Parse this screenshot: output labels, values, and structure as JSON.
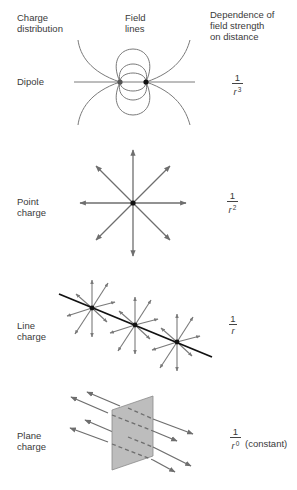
{
  "headers": {
    "charge_distribution": [
      "Charge",
      "distribution"
    ],
    "field_lines": [
      "Field",
      "lines"
    ],
    "dependence": [
      "Dependence of",
      "field strength",
      "on distance"
    ]
  },
  "rows": [
    {
      "label": [
        "Dipole"
      ],
      "diagram": "dipole-field-lines",
      "fraction": {
        "numerator": "1",
        "denominator": "r",
        "exponent": "3",
        "note": ""
      }
    },
    {
      "label": [
        "Point",
        "charge"
      ],
      "diagram": "point-charge-radial-arrows",
      "fraction": {
        "numerator": "1",
        "denominator": "r",
        "exponent": "2",
        "note": ""
      }
    },
    {
      "label": [
        "Line",
        "charge"
      ],
      "diagram": "line-charge-radial-arrows",
      "fraction": {
        "numerator": "1",
        "denominator": "r",
        "exponent": "",
        "note": ""
      }
    },
    {
      "label": [
        "Plane",
        "charge"
      ],
      "diagram": "plane-charge-parallel-arrows",
      "fraction": {
        "numerator": "1",
        "denominator": "r",
        "exponent": "0",
        "note": "(constant)"
      }
    }
  ],
  "colors": {
    "line": "#6e6e6e",
    "charge": "#111111",
    "plane_fill": "#bdbdbd",
    "text": "#3a3a3a"
  }
}
